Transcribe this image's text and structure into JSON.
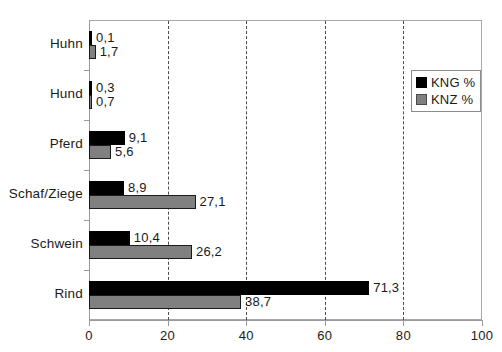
{
  "chart_data": {
    "type": "bar",
    "orientation": "horizontal",
    "title": "",
    "xlabel": "",
    "ylabel": "",
    "categories": [
      "Huhn",
      "Hund",
      "Pferd",
      "Schaf/Ziege",
      "Schwein",
      "Rind"
    ],
    "series": [
      {
        "name": "KNG %",
        "color": "#000000",
        "values": [
          0.1,
          0.3,
          9.1,
          8.9,
          10.4,
          71.3
        ],
        "labels": [
          "0,1",
          "0,3",
          "9,1",
          "8,9",
          "10,4",
          "71,3"
        ]
      },
      {
        "name": "KNZ %",
        "color": "#808080",
        "values": [
          1.7,
          0.7,
          5.6,
          27.1,
          26.2,
          38.7
        ],
        "labels": [
          "1,7",
          "0,7",
          "5,6",
          "27,1",
          "26,2",
          "38,7"
        ]
      }
    ],
    "xlim": [
      0,
      100
    ],
    "xticks": [
      0,
      20,
      40,
      60,
      80,
      100
    ],
    "xticklabels": [
      "0",
      "20",
      "40",
      "60",
      "80",
      "100"
    ],
    "gridlines": [
      20,
      40,
      60,
      80
    ],
    "grid": true,
    "grid_style": "dashed",
    "legend_position": "top-right",
    "decimal_separator": ","
  },
  "legend": {
    "entries": [
      {
        "label": "KNG %",
        "swatch": "black-square-swatch"
      },
      {
        "label": "KNZ %",
        "swatch": "gray-square-swatch"
      }
    ]
  }
}
